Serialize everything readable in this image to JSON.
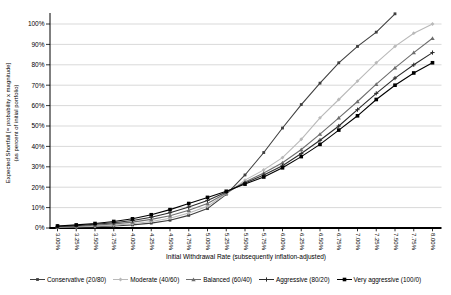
{
  "chart_data": {
    "type": "line",
    "title": "",
    "xlabel": "Initial Withdrawal Rate (subsequently inflation-adjusted)",
    "ylabel": "Expected Shortfall [= probability x magnitude]",
    "ylabel_sub": "(as percent of initial portfolio)",
    "x_tick_labels": [
      "3.00%",
      "3.25%",
      "3.50%",
      "3.75%",
      "4.00%",
      "4.25%",
      "4.50%",
      "4.75%",
      "5.00%",
      "5.25%",
      "5.50%",
      "5.75%",
      "6.00%",
      "6.25%",
      "6.50%",
      "6.75%",
      "7.00%",
      "7.25%",
      "7.50%",
      "7.75%",
      "8.00%"
    ],
    "x": [
      3.0,
      3.25,
      3.5,
      3.75,
      4.0,
      4.25,
      4.5,
      4.75,
      5.0,
      5.25,
      5.5,
      5.75,
      6.0,
      6.25,
      6.5,
      6.75,
      7.0,
      7.25,
      7.5,
      7.75,
      8.0
    ],
    "y_tick_labels": [
      "0%",
      "10%",
      "20%",
      "30%",
      "40%",
      "50%",
      "60%",
      "70%",
      "80%",
      "90%",
      "100%"
    ],
    "ylim": [
      0,
      100
    ],
    "y_major_step": 10,
    "grid": "horizontal-major",
    "legend_position": "bottom",
    "background": "#ffffff",
    "axis_color": "#000000",
    "grid_color": "#c9c9c9",
    "series": [
      {
        "name": "Conservative (20/80)",
        "marker": "square",
        "color": "#3f3f3f",
        "values": [
          0.3,
          0.4,
          0.6,
          1.0,
          1.5,
          2.4,
          3.8,
          6.2,
          9.5,
          16.5,
          26,
          37,
          49,
          60.5,
          71,
          81,
          89,
          96,
          105,
          null,
          null
        ]
      },
      {
        "name": "Moderate (40/60)",
        "marker": "diamond",
        "color": "#b9b9b9",
        "values": [
          0.4,
          0.6,
          0.9,
          1.4,
          2.1,
          3.2,
          4.8,
          7.3,
          10.7,
          16.8,
          23.5,
          28.5,
          34.5,
          43.5,
          54,
          63,
          72,
          81,
          89,
          95.5,
          100
        ]
      },
      {
        "name": "Balanced (60/40)",
        "marker": "triangle",
        "color": "#6e6e6e",
        "values": [
          0.6,
          0.9,
          1.3,
          2.0,
          2.9,
          4.2,
          6.0,
          8.7,
          12.0,
          17.2,
          22.5,
          27,
          32,
          38.5,
          46,
          54,
          62,
          70.5,
          78.5,
          86,
          93
        ]
      },
      {
        "name": "Aggressive (80/20)",
        "marker": "plus",
        "color": "#2b2b2b",
        "values": [
          0.8,
          1.2,
          1.8,
          2.6,
          3.7,
          5.3,
          7.5,
          10.3,
          13.5,
          17.6,
          22,
          26,
          30.5,
          36.5,
          43,
          50,
          58,
          66,
          73.5,
          80,
          86
        ]
      },
      {
        "name": "Very aggressive (100/0)",
        "marker": "square-large",
        "color": "#000000",
        "values": [
          1.0,
          1.5,
          2.2,
          3.2,
          4.5,
          6.5,
          9.0,
          12.0,
          15.0,
          18.0,
          21.5,
          25,
          29.5,
          35,
          41,
          48,
          55,
          63,
          70,
          76,
          81
        ]
      }
    ]
  }
}
